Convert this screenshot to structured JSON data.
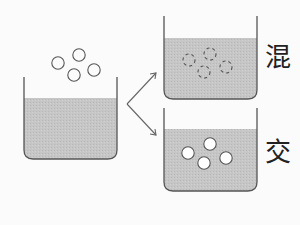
{
  "diagram": {
    "labels": {
      "top_right": "混",
      "bottom_right": "交"
    },
    "colors": {
      "liquid": "#c4c4c4",
      "outline": "#555555",
      "background": "#fbfbfb"
    },
    "beakers": [
      {
        "name": "source-beaker",
        "particles": 4,
        "particle_style": "solid-outline-above-liquid"
      },
      {
        "name": "mixed-beaker",
        "particles": 4,
        "particle_style": "dashed-dissolved"
      },
      {
        "name": "unmixed-beaker",
        "particles": 4,
        "particle_style": "solid-white-suspended"
      }
    ]
  }
}
